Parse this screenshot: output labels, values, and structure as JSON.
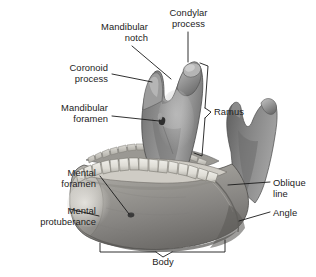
{
  "figure": {
    "background_color": "#ffffff",
    "label_text_color": "#1c1c1c",
    "leader_line_color": "#1a1a1a",
    "bone_colors": {
      "bone_mid": "#8e8e8e",
      "bone_light": "#c9c9c9",
      "bone_dark": "#5d5d5d",
      "bone_shadow": "#434343",
      "tooth_light": "#e8e6e1",
      "tooth_shade": "#b9b6ae",
      "highlight": "#dcdad4"
    }
  },
  "labels": {
    "mandibular_notch": "Mandibular\nnotch",
    "mandibular_notch_line1": "Mandibular",
    "mandibular_notch_line2": "notch",
    "condylar_process_line1": "Condylar",
    "condylar_process_line2": "process",
    "coronoid_process_line1": "Coronoid",
    "coronoid_process_line2": "process",
    "mandibular_foramen_line1": "Mandibular",
    "mandibular_foramen_line2": "foramen",
    "ramus": "Ramus",
    "mental_foramen_line1": "Mental",
    "mental_foramen_line2": "foramen",
    "mental_protuberance_line1": "Mental",
    "mental_protuberance_line2": "protuberance",
    "oblique_line_line1": "Oblique",
    "oblique_line_line2": "line",
    "angle": "Angle",
    "body": "Body"
  },
  "annotations": [
    {
      "name": "mandibular-notch",
      "text": "Mandibular notch",
      "leader": "diagonal",
      "anchor": "mandibular notch between coronoid and condylar process"
    },
    {
      "name": "condylar-process",
      "text": "Condylar process",
      "leader": "vertical",
      "anchor": "rounded posterior superior process of ramus"
    },
    {
      "name": "coronoid-process",
      "text": "Coronoid process",
      "leader": "horizontal",
      "anchor": "pointed anterior superior process of ramus"
    },
    {
      "name": "mandibular-foramen",
      "text": "Mandibular foramen",
      "leader": "horizontal",
      "anchor": "opening on medial surface of ramus"
    },
    {
      "name": "ramus",
      "text": "Ramus",
      "leader": "bracket",
      "anchor": "vertical posterior portion of mandible"
    },
    {
      "name": "mental-foramen",
      "text": "Mental foramen",
      "leader": "diagonal",
      "anchor": "opening on lateral surface of body"
    },
    {
      "name": "mental-protuberance",
      "text": "Mental protuberance",
      "leader": "horizontal",
      "anchor": "chin prominence"
    },
    {
      "name": "oblique-line",
      "text": "Oblique line",
      "leader": "horizontal",
      "anchor": "ridge on lateral body near ramus junction"
    },
    {
      "name": "angle",
      "text": "Angle",
      "leader": "horizontal",
      "anchor": "junction of ramus and body"
    },
    {
      "name": "body",
      "text": "Body",
      "leader": "bracket",
      "anchor": "horizontal anterior portion of mandible"
    }
  ]
}
